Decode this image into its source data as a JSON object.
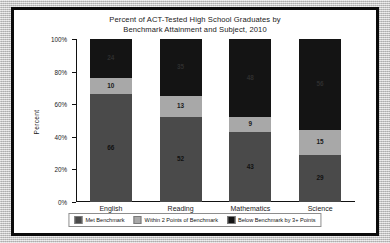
{
  "chart_data": {
    "type": "bar",
    "subtype": "stacked-bar-100-percent",
    "title": "Percent of ACT-Tested High School Graduates by Benchmark Attainment and Subject, 2010",
    "title_lines": [
      "Percent of ACT-Tested High School Graduates by",
      "Benchmark Attainment and Subject, 2010"
    ],
    "xlabel": "",
    "ylabel": "Percent",
    "categories": [
      "English",
      "Reading",
      "Mathematics",
      "Science"
    ],
    "ylim": [
      0,
      100
    ],
    "ytick_labels": [
      "0%",
      "20%",
      "40%",
      "60%",
      "80%",
      "100%"
    ],
    "ytick_values": [
      0,
      20,
      40,
      60,
      80,
      100
    ],
    "grid": false,
    "legend_position": "bottom",
    "stack_order_bottom_to_top": [
      "Met Benchmark",
      "Within 2 Points of Benchmark",
      "Below Benchmark by 3+ Points"
    ],
    "series": [
      {
        "name": "Met Benchmark",
        "color": "#4a4a4a",
        "values": [
          66,
          52,
          43,
          29
        ],
        "labels": [
          "66",
          "52",
          "43",
          "29"
        ]
      },
      {
        "name": "Within 2 Points of Benchmark",
        "color": "#a8a8a8",
        "values": [
          10,
          13,
          9,
          15
        ],
        "labels": [
          "10",
          "13",
          "9",
          "15"
        ]
      },
      {
        "name": "Below Benchmark by 3+ Points",
        "color": "#141414",
        "values": [
          24,
          35,
          48,
          56
        ],
        "labels": [
          "24",
          "35",
          "48",
          "56"
        ]
      }
    ]
  },
  "legend": {
    "items": [
      {
        "label": "Met Benchmark",
        "color": "#4a4a4a"
      },
      {
        "label": "Within 2 Points of Benchmark",
        "color": "#a8a8a8"
      },
      {
        "label": "Below Benchmark by 3+ Points",
        "color": "#141414"
      }
    ]
  }
}
